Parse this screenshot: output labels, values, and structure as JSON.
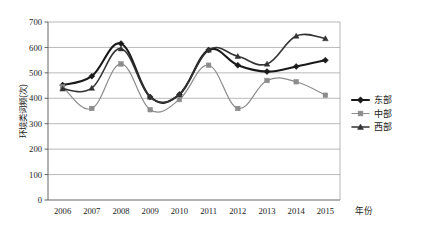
{
  "chart_data": {
    "type": "line",
    "title": "",
    "xlabel": "年份",
    "ylabel": "环境类词频(次)",
    "categories": [
      "2006",
      "2007",
      "2008",
      "2009",
      "2010",
      "2011",
      "2012",
      "2013",
      "2014",
      "2015"
    ],
    "ylim": [
      0,
      700
    ],
    "ytick_values": [
      0,
      100,
      200,
      300,
      400,
      500,
      600,
      700
    ],
    "ytick_labels": [
      "0",
      "100",
      "200",
      "300",
      "400",
      "500",
      "600",
      "700"
    ],
    "grid": true,
    "legend_position": "right",
    "series": [
      {
        "name": "东部",
        "marker": "diamond",
        "color": "#1a1a1a",
        "values": [
          452,
          487,
          615,
          405,
          415,
          590,
          530,
          505,
          525,
          550
        ]
      },
      {
        "name": "中部",
        "marker": "square",
        "color": "#8c8c8c",
        "values": [
          445,
          360,
          535,
          355,
          395,
          530,
          360,
          470,
          465,
          412
        ]
      },
      {
        "name": "西部",
        "marker": "triangle",
        "color": "#333333",
        "values": [
          437,
          440,
          595,
          405,
          415,
          590,
          565,
          535,
          645,
          635
        ]
      }
    ]
  },
  "legend": {
    "items": [
      {
        "label": "东部"
      },
      {
        "label": "中部"
      },
      {
        "label": "西部"
      }
    ]
  }
}
